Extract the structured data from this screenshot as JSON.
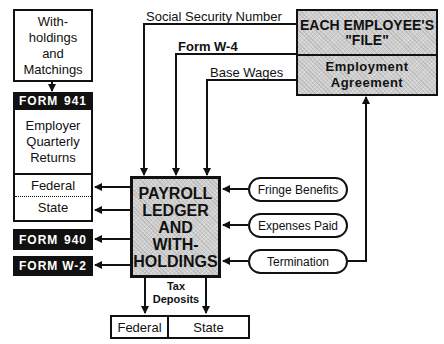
{
  "withholdings_box": {
    "lines": [
      "With-",
      "holdings",
      "and",
      "Matchings"
    ]
  },
  "form_941": {
    "form": "FORM",
    "number": "941"
  },
  "quarterly_returns": {
    "lines": [
      "Employer",
      "Quarterly",
      "Returns"
    ],
    "federal": "Federal",
    "state": "State"
  },
  "form_940": {
    "form": "FORM",
    "number": "940"
  },
  "form_w2": {
    "form": "FORM",
    "number": "W-2"
  },
  "payroll_box": {
    "lines": [
      "PAYROLL",
      "LEDGER",
      "AND",
      "WITH-",
      "HOLDINGS"
    ]
  },
  "employee_file": {
    "title_lines": [
      "EACH EMPLOYEE'S",
      "\"FILE\""
    ],
    "agreement_lines": [
      "Employment",
      "Agreement"
    ]
  },
  "inputs": {
    "ssn": "Social Security Number",
    "w4": "Form  W-4",
    "base_wages": "Base Wages"
  },
  "side_inputs": {
    "fringe": "Fringe Benefits",
    "expenses": "Expenses Paid",
    "termination": "Termination"
  },
  "tax_deposits": {
    "lines": [
      "Tax",
      "Deposits"
    ],
    "federal": "Federal",
    "state": "State"
  },
  "colors": {
    "line": "#111111",
    "fill_gray": "#cfcfcf",
    "black_bar": "#111111"
  }
}
